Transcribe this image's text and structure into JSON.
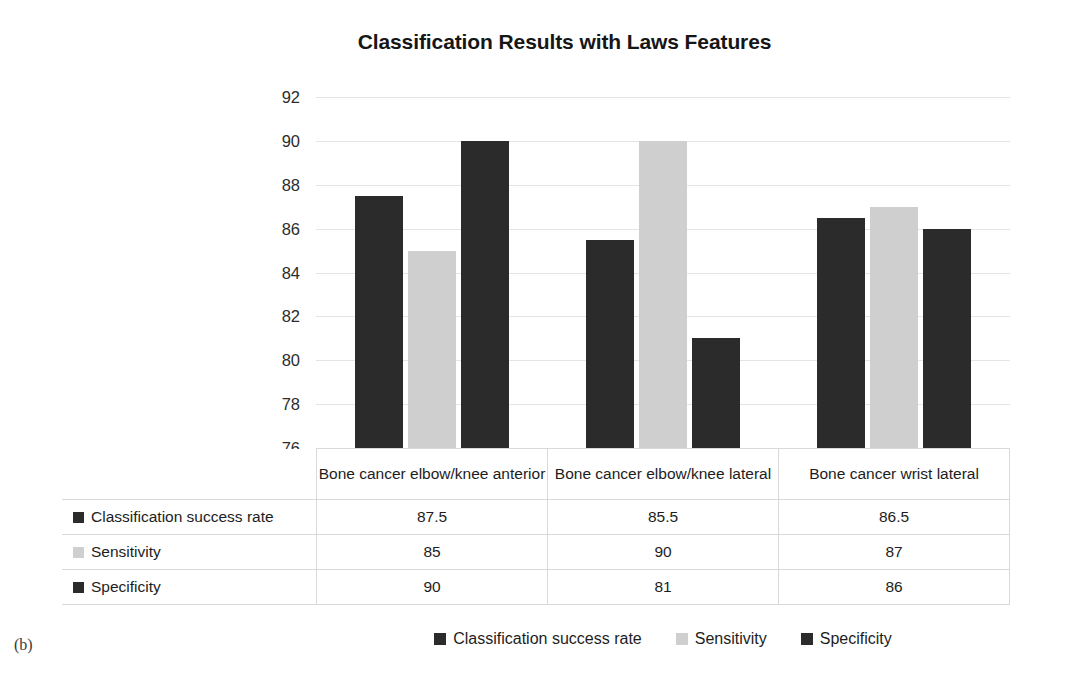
{
  "figure_label": "(b)",
  "chart_data": {
    "type": "bar",
    "title": "Classification Results with Laws Features",
    "xlabel": "",
    "ylabel": "",
    "ylim": [
      76,
      92
    ],
    "ytick_step": 2,
    "yticks": [
      92,
      90,
      88,
      86,
      84,
      82,
      80,
      78,
      76
    ],
    "grid": true,
    "legend_position": "bottom",
    "categories": [
      "Bone cancer elbow/knee anterior",
      "Bone cancer elbow/knee lateral",
      "Bone cancer wrist lateral"
    ],
    "series": [
      {
        "name": "Classification success rate",
        "color": "#2b2b2b",
        "values": [
          87.5,
          85.5,
          86.5
        ]
      },
      {
        "name": "Sensitivity",
        "color": "#cfcfcf",
        "values": [
          85,
          90,
          87
        ]
      },
      {
        "name": "Specificity",
        "color": "#2b2b2b",
        "values": [
          90,
          81,
          86
        ]
      }
    ]
  },
  "table": {
    "corner": "",
    "column_headers": [
      "Bone cancer elbow/knee anterior",
      "Bone cancer elbow/knee lateral",
      "Bone cancer wrist lateral"
    ],
    "rows": [
      {
        "label": "Classification success rate",
        "swatch": "#2b2b2b",
        "cells": [
          "87.5",
          "85.5",
          "86.5"
        ]
      },
      {
        "label": "Sensitivity",
        "swatch": "#cfcfcf",
        "cells": [
          "85",
          "90",
          "87"
        ]
      },
      {
        "label": "Specificity",
        "swatch": "#2b2b2b",
        "cells": [
          "90",
          "81",
          "86"
        ]
      }
    ]
  },
  "legend": {
    "items": [
      {
        "label": "Classification success rate",
        "color": "#2b2b2b"
      },
      {
        "label": "Sensitivity",
        "color": "#cfcfcf"
      },
      {
        "label": "Specificity",
        "color": "#2b2b2b"
      }
    ]
  }
}
